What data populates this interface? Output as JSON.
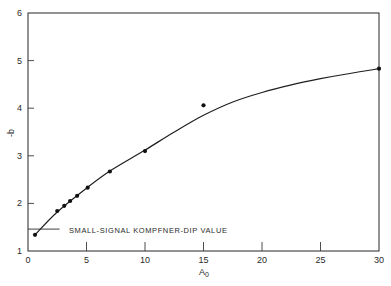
{
  "chart_data": {
    "type": "scatter",
    "title": "",
    "xlabel": "A0",
    "ylabel": "-b",
    "xlim": [
      0,
      30
    ],
    "ylim": [
      1,
      6
    ],
    "grid": false,
    "legend": null,
    "x_ticks": [
      0,
      5,
      10,
      15,
      20,
      25,
      30
    ],
    "y_ticks": [
      1,
      2,
      3,
      4,
      5,
      6
    ],
    "x_tick_labels": [
      "0",
      "5",
      "10",
      "15",
      "20",
      "25",
      "30"
    ],
    "y_tick_labels": [
      "1",
      "2",
      "3",
      "4",
      "5",
      "6"
    ],
    "series": [
      {
        "name": "measured points",
        "kind": "scatter",
        "x": [
          0.6,
          2.5,
          3.1,
          3.6,
          4.2,
          5.1,
          7.0,
          10.0,
          15.0,
          30.0
        ],
        "y": [
          1.34,
          1.84,
          1.95,
          2.05,
          2.16,
          2.33,
          2.67,
          3.1,
          4.06,
          4.83
        ]
      },
      {
        "name": "fitted curve",
        "kind": "line",
        "x": [
          0.6,
          2.5,
          5,
          7,
          10,
          12.5,
          15,
          17.5,
          20,
          22.5,
          25,
          27.5,
          30
        ],
        "y": [
          1.34,
          1.82,
          2.32,
          2.68,
          3.12,
          3.5,
          3.85,
          4.13,
          4.33,
          4.49,
          4.62,
          4.73,
          4.83
        ]
      }
    ],
    "annotations": [
      {
        "text": "SMALL-SIGNAL KOMPFNER-DIP VALUE",
        "y": 1.46,
        "type": "horizontal-marker-line",
        "x_range": [
          0,
          2.7
        ]
      }
    ]
  },
  "labels": {
    "xlabel_main": "A",
    "xlabel_sub": "0",
    "ylabel": "-b",
    "annotation": "SMALL-SIGNAL KOMPFNER-DIP VALUE"
  }
}
